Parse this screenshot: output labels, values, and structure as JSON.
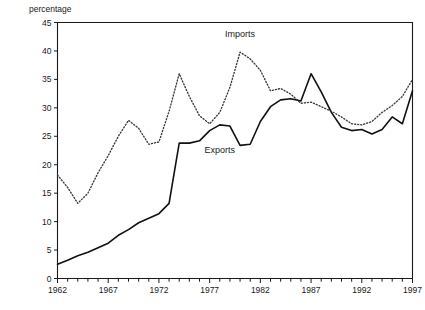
{
  "chart_data": {
    "type": "line",
    "title": "",
    "subtitle": "",
    "xlabel": "",
    "ylabel": "percentage",
    "ylim": [
      0,
      45
    ],
    "xlim": [
      1962,
      1997
    ],
    "ytick_step": 5,
    "xtick_step": 1,
    "xtick_label_step": 5,
    "grid": false,
    "legend_position": "inline-annotations",
    "yticks": [
      0,
      5,
      10,
      15,
      20,
      25,
      30,
      35,
      40,
      45
    ],
    "ytick_labels": [
      "0",
      "5",
      "10",
      "15",
      "20",
      "25",
      "30",
      "35",
      "40",
      "45"
    ],
    "xticks": [
      1962,
      1963,
      1964,
      1965,
      1966,
      1967,
      1968,
      1969,
      1970,
      1971,
      1972,
      1973,
      1974,
      1975,
      1976,
      1977,
      1978,
      1979,
      1980,
      1981,
      1982,
      1983,
      1984,
      1985,
      1986,
      1987,
      1988,
      1989,
      1990,
      1991,
      1992,
      1993,
      1994,
      1995,
      1996,
      1997
    ],
    "xtick_labels": [
      "1962",
      "1967",
      "1972",
      "1977",
      "1982",
      "1987",
      "1992",
      "1997"
    ],
    "xtick_labeled_values": [
      1962,
      1967,
      1972,
      1977,
      1982,
      1987,
      1992,
      1997
    ],
    "x": [
      1962,
      1963,
      1964,
      1965,
      1966,
      1967,
      1968,
      1969,
      1970,
      1971,
      1972,
      1973,
      1974,
      1975,
      1976,
      1977,
      1978,
      1979,
      1980,
      1981,
      1982,
      1983,
      1984,
      1985,
      1986,
      1987,
      1988,
      1989,
      1990,
      1991,
      1992,
      1993,
      1994,
      1995,
      1996,
      1997
    ],
    "series": [
      {
        "name": "Exports",
        "style": "solid",
        "color": "#111111",
        "label_x": 1978,
        "label_y": 22.0,
        "values": [
          2.5,
          3.2,
          4.0,
          4.6,
          5.4,
          6.2,
          7.6,
          8.6,
          9.8,
          10.6,
          11.4,
          13.2,
          23.8,
          23.8,
          24.2,
          26.0,
          27.0,
          26.8,
          23.4,
          23.6,
          27.6,
          30.2,
          31.4,
          31.6,
          31.2,
          36.0,
          32.8,
          29.2,
          26.6,
          26.0,
          26.2,
          25.4,
          26.2,
          28.4,
          27.2,
          33.0
        ]
      },
      {
        "name": "Imports",
        "style": "dotted",
        "color": "#3a3a3a",
        "label_x": 1980,
        "label_y": 42.5,
        "values": [
          18.2,
          16.0,
          13.2,
          15.0,
          18.6,
          21.6,
          25.0,
          27.8,
          26.4,
          23.6,
          24.0,
          29.4,
          36.0,
          32.0,
          28.6,
          27.2,
          29.2,
          33.6,
          39.8,
          38.6,
          36.6,
          33.0,
          33.4,
          32.4,
          30.8,
          31.0,
          30.2,
          29.4,
          28.4,
          27.2,
          27.0,
          27.6,
          29.2,
          30.4,
          32.0,
          35.0
        ]
      }
    ],
    "annotations": [
      {
        "text": "Imports",
        "x": 1980,
        "y": 42.5
      },
      {
        "text": "Exports",
        "x": 1978,
        "y": 22.0
      }
    ]
  },
  "axis": {
    "y_axis_title": "percentage"
  }
}
